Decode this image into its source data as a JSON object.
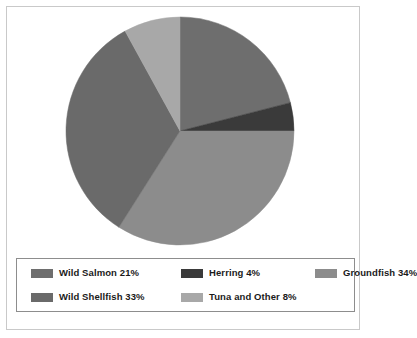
{
  "chart_data": {
    "type": "pie",
    "title": "",
    "subtitle": "",
    "xlabel": "",
    "ylabel": "",
    "legend_position": "bottom",
    "grid": false,
    "start_angle_deg": 0,
    "direction": "clockwise",
    "units": "percent",
    "total": 100,
    "categories": [
      "Wild Salmon",
      "Herring",
      "Groundfish",
      "Wild Shellfish",
      "Tuna and Other"
    ],
    "values": [
      21,
      4,
      34,
      33,
      8
    ],
    "colors": [
      "#6e6e6e",
      "#3a3a3a",
      "#8c8c8c",
      "#6a6a6a",
      "#a8a8a8"
    ],
    "slices": [
      {
        "label": "Wild Salmon",
        "value": 21,
        "display": "21%",
        "color": "#6e6e6e",
        "legend_text": "Wild Salmon 21%"
      },
      {
        "label": "Herring",
        "value": 4,
        "display": "4%",
        "color": "#3a3a3a",
        "legend_text": "Herring 4%"
      },
      {
        "label": "Groundfish",
        "value": 34,
        "display": "34%",
        "color": "#8c8c8c",
        "legend_text": "Groundfish 34%"
      },
      {
        "label": "Wild Shellfish",
        "value": 33,
        "display": "33%",
        "color": "#6a6a6a",
        "legend_text": "Wild Shellfish 33%"
      },
      {
        "label": "Tuna and Other",
        "value": 8,
        "display": "8%",
        "color": "#a8a8a8",
        "legend_text": "Tuna and Other 8%"
      }
    ]
  },
  "legend": {
    "items": [
      {
        "text": "Wild Salmon 21%",
        "color": "#6e6e6e"
      },
      {
        "text": "Herring 4%",
        "color": "#3a3a3a"
      },
      {
        "text": "Groundfish 34%",
        "color": "#8c8c8c"
      },
      {
        "text": "Wild Shellfish 33%",
        "color": "#6a6a6a"
      },
      {
        "text": "Tuna and Other 8%",
        "color": "#a8a8a8"
      }
    ]
  },
  "frame": {
    "border_color": "#c9c9c9",
    "legend_border_color": "#8d8d8d",
    "background": "#ffffff"
  }
}
